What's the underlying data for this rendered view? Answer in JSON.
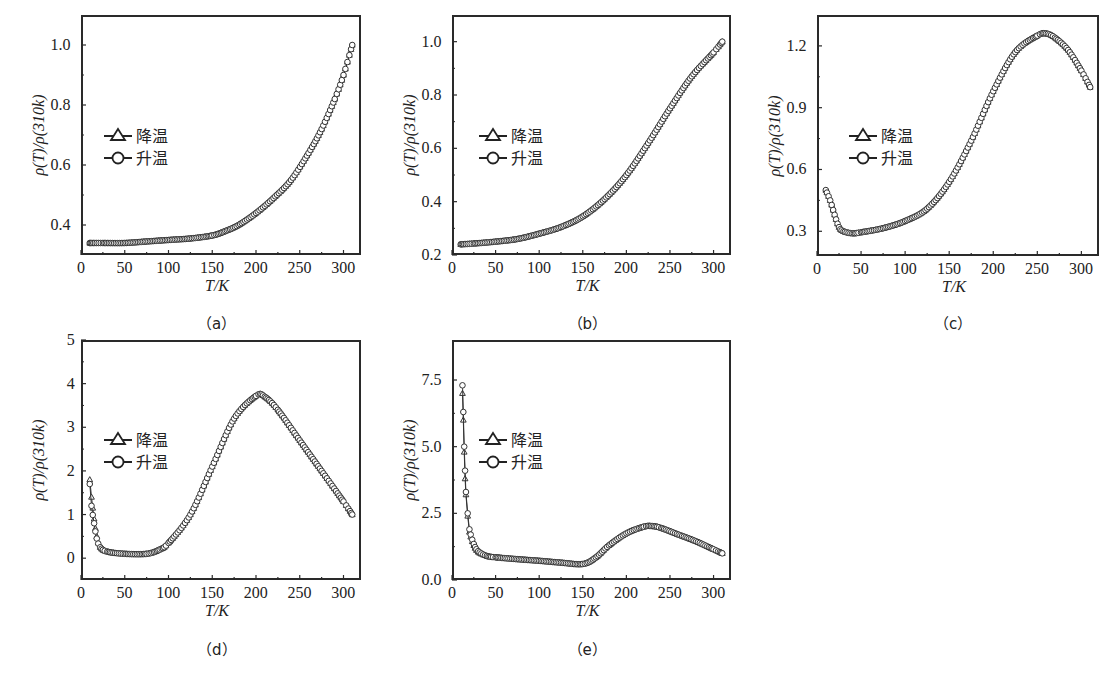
{
  "legend": {
    "cooling": "降温",
    "heating": "升温"
  },
  "axes": {
    "ylabel": "ρ(T)/ρ(310k)",
    "xlabel": "T/K"
  },
  "chart_data": [
    {
      "id": "a",
      "caption": "（a）",
      "type": "scatter",
      "title": "",
      "xlabel": "T/K",
      "ylabel": "ρ(T)/ρ(310k)",
      "xlim": [
        0,
        320
      ],
      "ylim": [
        0.3,
        1.1
      ],
      "xticks": [
        0,
        50,
        100,
        150,
        200,
        250,
        300
      ],
      "yticks": [
        0.4,
        0.6,
        0.8,
        1.0
      ],
      "ytick_labels": [
        "0.4",
        "0.6",
        "0.8",
        "1.0"
      ],
      "legend": [
        "降温",
        "升温"
      ],
      "legend_position": "center-left",
      "series": [
        {
          "name": "降温",
          "marker": "triangle",
          "x": [
            10,
            25,
            50,
            75,
            100,
            125,
            150,
            165,
            180,
            200,
            220,
            240,
            260,
            275,
            290,
            300,
            310
          ],
          "y": [
            0.34,
            0.34,
            0.34,
            0.345,
            0.35,
            0.355,
            0.365,
            0.38,
            0.4,
            0.44,
            0.49,
            0.55,
            0.64,
            0.72,
            0.82,
            0.9,
            1.0
          ]
        },
        {
          "name": "升温",
          "marker": "circle",
          "x": [
            10,
            25,
            50,
            75,
            100,
            125,
            150,
            165,
            180,
            200,
            220,
            240,
            260,
            275,
            290,
            300,
            310
          ],
          "y": [
            0.34,
            0.34,
            0.34,
            0.345,
            0.35,
            0.355,
            0.365,
            0.38,
            0.4,
            0.44,
            0.49,
            0.55,
            0.64,
            0.72,
            0.82,
            0.9,
            1.0
          ]
        }
      ]
    },
    {
      "id": "b",
      "caption": "（b）",
      "type": "scatter",
      "title": "",
      "xlabel": "T/K",
      "ylabel": "ρ(T)/ρ(310k)",
      "xlim": [
        0,
        320
      ],
      "ylim": [
        0.2,
        1.1
      ],
      "xticks": [
        0,
        50,
        100,
        150,
        200,
        250,
        300
      ],
      "yticks": [
        0.2,
        0.4,
        0.6,
        0.8,
        1.0
      ],
      "ytick_labels": [
        "0.2",
        "0.4",
        "0.6",
        "0.8",
        "1.0"
      ],
      "legend": [
        "降温",
        "升温"
      ],
      "legend_position": "center-left",
      "series": [
        {
          "name": "降温",
          "marker": "triangle",
          "x": [
            10,
            25,
            50,
            75,
            100,
            125,
            150,
            175,
            200,
            225,
            250,
            275,
            300,
            310
          ],
          "y": [
            0.24,
            0.243,
            0.25,
            0.26,
            0.28,
            0.305,
            0.345,
            0.41,
            0.5,
            0.62,
            0.75,
            0.87,
            0.96,
            1.0
          ]
        },
        {
          "name": "升温",
          "marker": "circle",
          "x": [
            10,
            25,
            50,
            75,
            100,
            125,
            150,
            175,
            200,
            225,
            250,
            275,
            300,
            310
          ],
          "y": [
            0.24,
            0.243,
            0.25,
            0.26,
            0.28,
            0.305,
            0.345,
            0.41,
            0.5,
            0.62,
            0.75,
            0.87,
            0.96,
            1.0
          ]
        }
      ]
    },
    {
      "id": "c",
      "caption": "（c）",
      "type": "scatter",
      "title": "",
      "xlabel": "T/K",
      "ylabel": "ρ(T)/ρ(310k)",
      "xlim": [
        0,
        320
      ],
      "ylim": [
        0.18,
        1.35
      ],
      "xticks": [
        0,
        50,
        100,
        150,
        200,
        250,
        300
      ],
      "yticks": [
        0.3,
        0.6,
        0.9,
        1.2
      ],
      "ytick_labels": [
        "0.3",
        "0.6",
        "0.9",
        "1.2"
      ],
      "legend": [
        "降温",
        "升温"
      ],
      "legend_position": "center-left",
      "series": [
        {
          "name": "降温",
          "marker": "triangle",
          "x": [
            10,
            15,
            20,
            25,
            30,
            40,
            50,
            75,
            100,
            125,
            150,
            175,
            200,
            225,
            250,
            260,
            270,
            285,
            300,
            310
          ],
          "y": [
            0.5,
            0.45,
            0.38,
            0.32,
            0.3,
            0.29,
            0.295,
            0.315,
            0.35,
            0.41,
            0.54,
            0.74,
            0.98,
            1.17,
            1.25,
            1.26,
            1.24,
            1.18,
            1.08,
            1.0
          ]
        },
        {
          "name": "升温",
          "marker": "circle",
          "x": [
            10,
            15,
            20,
            25,
            30,
            40,
            50,
            75,
            100,
            125,
            150,
            175,
            200,
            225,
            250,
            260,
            270,
            285,
            300,
            310
          ],
          "y": [
            0.5,
            0.45,
            0.38,
            0.32,
            0.3,
            0.29,
            0.295,
            0.315,
            0.35,
            0.41,
            0.54,
            0.74,
            0.98,
            1.17,
            1.25,
            1.26,
            1.24,
            1.18,
            1.08,
            1.0
          ]
        }
      ]
    },
    {
      "id": "d",
      "caption": "（d）",
      "type": "scatter",
      "title": "",
      "xlabel": "T/K",
      "ylabel": "ρ(T)/ρ(310k)",
      "xlim": [
        0,
        320
      ],
      "ylim": [
        -0.5,
        5
      ],
      "xticks": [
        0,
        50,
        100,
        150,
        200,
        250,
        300
      ],
      "yticks": [
        0,
        1,
        2,
        3,
        4,
        5
      ],
      "ytick_labels": [
        "0",
        "1",
        "2",
        "3",
        "4",
        "5"
      ],
      "legend": [
        "降温",
        "升温"
      ],
      "legend_position": "center-left",
      "series": [
        {
          "name": "降温",
          "marker": "triangle",
          "x": [
            10,
            12,
            15,
            18,
            22,
            30,
            50,
            75,
            90,
            100,
            125,
            150,
            175,
            200,
            210,
            225,
            250,
            275,
            300,
            310
          ],
          "y": [
            1.8,
            1.4,
            0.9,
            0.5,
            0.25,
            0.15,
            0.1,
            0.1,
            0.2,
            0.35,
            1.0,
            2.1,
            3.2,
            3.72,
            3.7,
            3.4,
            2.7,
            2.0,
            1.3,
            1.0
          ]
        },
        {
          "name": "升温",
          "marker": "circle",
          "x": [
            10,
            12,
            15,
            18,
            22,
            30,
            50,
            75,
            90,
            100,
            125,
            150,
            175,
            200,
            210,
            225,
            250,
            275,
            300,
            310
          ],
          "y": [
            1.7,
            1.2,
            0.8,
            0.45,
            0.25,
            0.15,
            0.1,
            0.1,
            0.2,
            0.35,
            1.0,
            2.1,
            3.2,
            3.72,
            3.7,
            3.4,
            2.7,
            2.0,
            1.3,
            1.0
          ]
        }
      ]
    },
    {
      "id": "e",
      "caption": "（e）",
      "type": "scatter",
      "title": "",
      "xlabel": "T/K",
      "ylabel": "ρ(T)/ρ(310k)",
      "xlim": [
        0,
        320
      ],
      "ylim": [
        0,
        9
      ],
      "xticks": [
        0,
        50,
        100,
        150,
        200,
        250,
        300
      ],
      "yticks": [
        0.0,
        2.5,
        5.0,
        7.5
      ],
      "ytick_labels": [
        "0.0",
        "2.5",
        "5.0",
        "7.5"
      ],
      "legend": [
        "降温",
        "升温"
      ],
      "legend_position": "center-left",
      "series": [
        {
          "name": "降温",
          "marker": "triangle",
          "x": [
            12,
            13,
            14,
            15,
            16,
            18,
            20,
            25,
            30,
            40,
            50,
            75,
            100,
            125,
            150,
            165,
            180,
            200,
            220,
            230,
            240,
            260,
            280,
            300,
            310
          ],
          "y": [
            7.0,
            6.0,
            4.8,
            3.8,
            3.2,
            2.4,
            1.8,
            1.3,
            1.05,
            0.9,
            0.85,
            0.78,
            0.72,
            0.65,
            0.6,
            0.85,
            1.3,
            1.75,
            2.0,
            2.02,
            1.95,
            1.7,
            1.45,
            1.15,
            1.0
          ]
        },
        {
          "name": "升温",
          "marker": "circle",
          "x": [
            12,
            13,
            14,
            15,
            16,
            18,
            20,
            25,
            30,
            40,
            50,
            75,
            100,
            125,
            150,
            165,
            180,
            200,
            220,
            230,
            240,
            260,
            280,
            300,
            310
          ],
          "y": [
            7.3,
            6.3,
            5.0,
            4.1,
            3.3,
            2.5,
            1.9,
            1.35,
            1.08,
            0.9,
            0.85,
            0.78,
            0.72,
            0.65,
            0.6,
            0.85,
            1.3,
            1.75,
            2.0,
            2.02,
            1.95,
            1.7,
            1.45,
            1.15,
            1.0
          ]
        }
      ]
    }
  ]
}
